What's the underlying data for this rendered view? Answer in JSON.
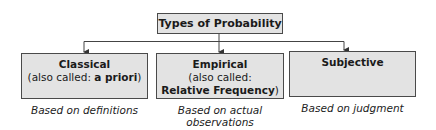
{
  "diagram": {
    "title": "Types of Probability",
    "categories": [
      {
        "name": "Classical",
        "note_prefix": "(also called: ",
        "note_bold": "a priori",
        "note_suffix": ")",
        "caption": "Based on definitions"
      },
      {
        "name": "Empirical",
        "note_line1": "(also called:",
        "note_bold": "Relative Frequency",
        "note_suffix": ")",
        "caption_line1": "Based on actual",
        "caption_line2": "observations"
      },
      {
        "name": "Subjective",
        "caption": "Based on judgment"
      }
    ],
    "colors": {
      "box_fill": "#e3e3e3",
      "box_border": "#4a4a4a",
      "line": "#333333"
    }
  }
}
